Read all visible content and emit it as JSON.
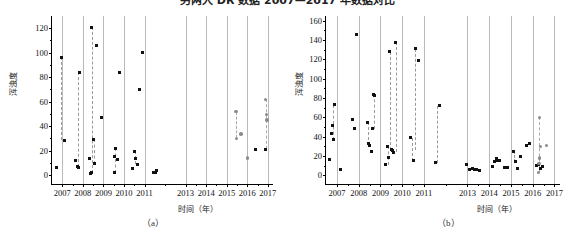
{
  "figure": {
    "title": "另两大 DR 数据 2007—2017 年数据对比",
    "caption_a": "（a）",
    "caption_b": "（b）"
  },
  "chart_data": [
    {
      "id": "a",
      "type": "scatter",
      "title": "",
      "xlabel": "时间（年）",
      "ylabel": "浑浊度",
      "xlim": [
        2006.5,
        2017.3
      ],
      "ylim": [
        -8,
        130
      ],
      "yticks": [
        0,
        20,
        40,
        60,
        80,
        100,
        120
      ],
      "xticks": [
        2007,
        2008,
        2009,
        2010,
        2011,
        2013,
        2014,
        2015,
        2016,
        2017
      ],
      "xtick_labels": [
        "2007",
        "2008",
        "2009",
        "2010",
        "2011",
        "2013",
        "2014",
        "2015",
        "2016",
        "2017"
      ],
      "grid": "vertical",
      "legend": "none",
      "series": [
        {
          "name": "黑色方点",
          "marker": "square",
          "color": "#111111",
          "points": [
            [
              2006.7,
              6
            ],
            [
              2006.95,
              96.5
            ],
            [
              2007.1,
              28.5
            ],
            [
              2007.62,
              12
            ],
            [
              2007.72,
              7
            ],
            [
              2007.8,
              6
            ],
            [
              2007.85,
              84
            ],
            [
              2008.33,
              14
            ],
            [
              2008.36,
              1
            ],
            [
              2008.4,
              2
            ],
            [
              2008.44,
              121
            ],
            [
              2008.52,
              29.5
            ],
            [
              2008.58,
              9.5
            ],
            [
              2008.66,
              106
            ],
            [
              2008.92,
              47
            ],
            [
              2009.52,
              15
            ],
            [
              2009.56,
              2
            ],
            [
              2009.6,
              22
            ],
            [
              2009.7,
              13
            ],
            [
              2009.78,
              83.5
            ],
            [
              2010.42,
              5.5
            ],
            [
              2010.5,
              19.5
            ],
            [
              2010.58,
              14
            ],
            [
              2010.66,
              9
            ],
            [
              2010.74,
              70
            ],
            [
              2010.9,
              100.5
            ],
            [
              2011.45,
              2
            ],
            [
              2011.52,
              2.5
            ],
            [
              2011.58,
              4
            ],
            [
              2016.42,
              21
            ],
            [
              2016.9,
              21
            ]
          ]
        },
        {
          "name": "灰色圆点",
          "marker": "circle",
          "color": "#8c8c8c",
          "points": [
            [
              2015.45,
              52
            ],
            [
              2015.48,
              30
            ],
            [
              2015.7,
              33.5
            ],
            [
              2016.0,
              14
            ],
            [
              2016.88,
              62
            ],
            [
              2016.92,
              49.5
            ],
            [
              2016.95,
              45
            ]
          ]
        }
      ],
      "connections": [
        {
          "x": 2006.95,
          "y0": 28.5,
          "y1": 96.5,
          "color": "#9a9a9a"
        },
        {
          "x": 2007.78,
          "y0": 7,
          "y1": 84,
          "color": "#9a9a9a"
        },
        {
          "x": 2008.44,
          "y0": 2,
          "y1": 121,
          "color": "#9a9a9a"
        },
        {
          "x": 2008.52,
          "y0": 9.5,
          "y1": 29.5,
          "color": "#9a9a9a"
        },
        {
          "x": 2009.58,
          "y0": 2,
          "y1": 22,
          "color": "#9a9a9a"
        },
        {
          "x": 2010.55,
          "y0": 9,
          "y1": 19.5,
          "color": "#9a9a9a"
        },
        {
          "x": 2015.46,
          "y0": 30,
          "y1": 52,
          "color": "#a8a8a8"
        },
        {
          "x": 2016.9,
          "y0": 21,
          "y1": 62,
          "color": "#a8a8a8"
        }
      ]
    },
    {
      "id": "b",
      "type": "scatter",
      "title": "",
      "xlabel": "时间（年）",
      "ylabel": "浑浊度",
      "xlim": [
        2006.5,
        2017.3
      ],
      "ylim": [
        -10,
        165
      ],
      "yticks": [
        0,
        20,
        40,
        60,
        80,
        100,
        120,
        140,
        160
      ],
      "xticks": [
        2007,
        2008,
        2009,
        2010,
        2011,
        2013,
        2014,
        2015,
        2016,
        2017
      ],
      "xtick_labels": [
        "2007",
        "2008",
        "2009",
        "2010",
        "2011",
        "2013",
        "2014",
        "2015",
        "2016",
        "2017"
      ],
      "grid": "vertical",
      "legend": "none",
      "series": [
        {
          "name": "黑色方点",
          "marker": "square",
          "color": "#111111",
          "points": [
            [
              2006.66,
              16
            ],
            [
              2006.74,
              43
            ],
            [
              2006.8,
              52
            ],
            [
              2006.84,
              37
            ],
            [
              2006.9,
              73
            ],
            [
              2007.18,
              6
            ],
            [
              2007.72,
              58
            ],
            [
              2007.8,
              48
            ],
            [
              2007.92,
              146
            ],
            [
              2008.4,
              55
            ],
            [
              2008.46,
              33
            ],
            [
              2008.52,
              31
            ],
            [
              2008.58,
              25
            ],
            [
              2008.64,
              48
            ],
            [
              2008.7,
              84
            ],
            [
              2008.74,
              83
            ],
            [
              2009.24,
              11
            ],
            [
              2009.32,
              30
            ],
            [
              2009.36,
              18
            ],
            [
              2009.42,
              128
            ],
            [
              2009.5,
              27
            ],
            [
              2009.56,
              26
            ],
            [
              2009.62,
              24
            ],
            [
              2009.7,
              138
            ],
            [
              2010.4,
              39
            ],
            [
              2010.52,
              15
            ],
            [
              2010.6,
              131
            ],
            [
              2010.74,
              119
            ],
            [
              2011.52,
              13
            ],
            [
              2011.7,
              72
            ],
            [
              2012.95,
              11
            ],
            [
              2013.1,
              6
            ],
            [
              2013.22,
              7
            ],
            [
              2013.32,
              6
            ],
            [
              2013.42,
              6
            ],
            [
              2013.55,
              5
            ],
            [
              2014.16,
              9
            ],
            [
              2014.24,
              14
            ],
            [
              2014.32,
              17
            ],
            [
              2014.4,
              15
            ],
            [
              2014.48,
              15
            ],
            [
              2014.72,
              8
            ],
            [
              2014.86,
              8
            ],
            [
              2015.1,
              25
            ],
            [
              2015.22,
              14
            ],
            [
              2015.3,
              7
            ],
            [
              2015.44,
              19
            ],
            [
              2015.7,
              31
            ],
            [
              2015.84,
              33
            ],
            [
              2016.18,
              10
            ],
            [
              2016.26,
              11
            ],
            [
              2016.34,
              7
            ],
            [
              2016.46,
              9
            ]
          ]
        },
        {
          "name": "灰色圆点",
          "marker": "circle",
          "color": "#8c8c8c",
          "points": [
            [
              2016.3,
              60
            ],
            [
              2016.36,
              30
            ],
            [
              2016.3,
              18
            ],
            [
              2016.28,
              12
            ],
            [
              2016.26,
              3
            ],
            [
              2016.62,
              31
            ]
          ]
        }
      ],
      "connections": [
        {
          "x": 2006.8,
          "y0": 37,
          "y1": 73,
          "color": "#9a9a9a"
        },
        {
          "x": 2008.44,
          "y0": 31,
          "y1": 55,
          "color": "#9a9a9a"
        },
        {
          "x": 2008.7,
          "y0": 48,
          "y1": 84,
          "color": "#9a9a9a"
        },
        {
          "x": 2009.34,
          "y0": 11,
          "y1": 30,
          "color": "#9a9a9a"
        },
        {
          "x": 2009.42,
          "y0": 26,
          "y1": 128,
          "color": "#9a9a9a"
        },
        {
          "x": 2009.7,
          "y0": 24,
          "y1": 138,
          "color": "#9a9a9a"
        },
        {
          "x": 2010.46,
          "y0": 15,
          "y1": 39,
          "color": "#9a9a9a"
        },
        {
          "x": 2010.6,
          "y0": 26,
          "y1": 131,
          "color": "#9a9a9a"
        },
        {
          "x": 2011.6,
          "y0": 13,
          "y1": 72,
          "color": "#9a9a9a"
        },
        {
          "x": 2015.16,
          "y0": 14,
          "y1": 25,
          "color": "#9a9a9a"
        },
        {
          "x": 2016.3,
          "y0": 3,
          "y1": 60,
          "color": "#a8a8a8"
        }
      ]
    }
  ]
}
